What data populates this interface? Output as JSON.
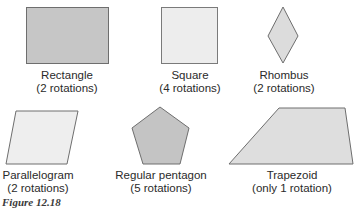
{
  "figure": {
    "caption": "Figure 12.18",
    "shapes": [
      {
        "name": "Rectangle",
        "rotations": "(2 rotations)",
        "fill": "#c6c6c6"
      },
      {
        "name": "Square",
        "rotations": "(4 rotations)",
        "fill": "#ededed"
      },
      {
        "name": "Rhombus",
        "rotations": "(2 rotations)",
        "fill": "#dcdcdc"
      },
      {
        "name": "Parallelogram",
        "rotations": "(2 rotations)",
        "fill": "#eeeeee"
      },
      {
        "name": "Regular pentagon",
        "rotations": "(5 rotations)",
        "fill": "#c4c4c4"
      },
      {
        "name": "Trapezoid",
        "rotations": "(only 1 rotation)",
        "fill": "#dedede"
      }
    ],
    "stroke_color": "#6e6e6e"
  }
}
